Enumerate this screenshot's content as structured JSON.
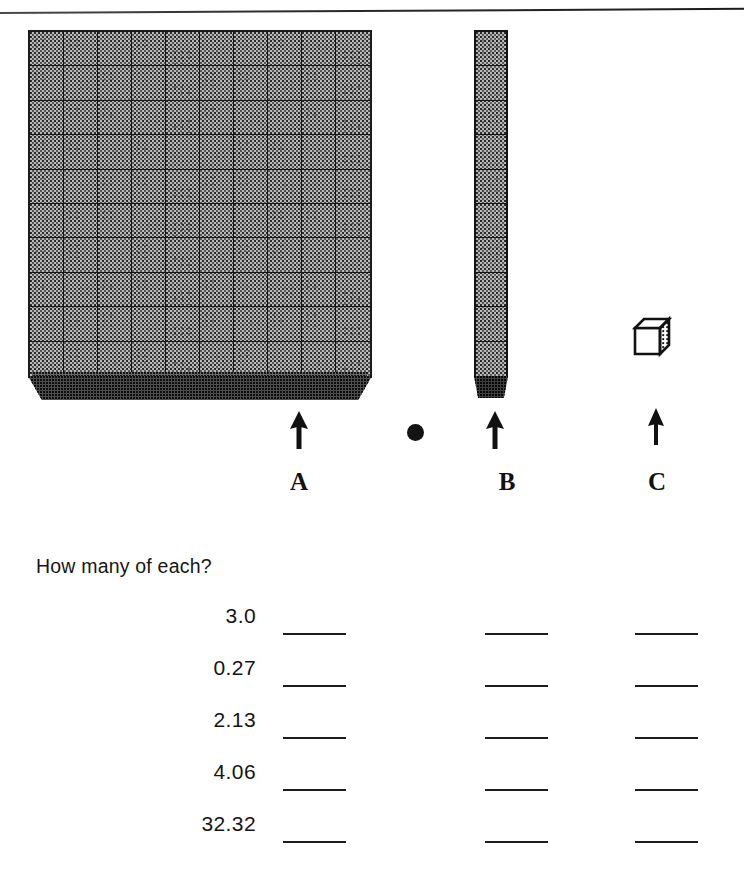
{
  "worksheet": {
    "question": "How many of each?",
    "columns": [
      {
        "label": "A",
        "icon": "hundreds-flat-block",
        "arrow": "up-arrow-icon"
      },
      {
        "label": "B",
        "icon": "tens-rod-block",
        "arrow": "up-arrow-icon"
      },
      {
        "label": "C",
        "icon": "unit-cube-block",
        "arrow": "up-arrow-icon"
      }
    ],
    "decimal_point": ".",
    "rows": [
      {
        "value": "3.0",
        "answer_a": "",
        "answer_b": "",
        "answer_c": ""
      },
      {
        "value": "0.27",
        "answer_a": "",
        "answer_b": "",
        "answer_c": ""
      },
      {
        "value": "2.13",
        "answer_a": "",
        "answer_b": "",
        "answer_c": ""
      },
      {
        "value": "4.06",
        "answer_a": "",
        "answer_b": "",
        "answer_c": ""
      },
      {
        "value": "32.32",
        "answer_a": "",
        "answer_b": "",
        "answer_c": ""
      }
    ],
    "colors": {
      "ink": "#141414",
      "block_fill": "#b9b9b9",
      "block_shadow": "#4e4e4e",
      "paper": "#ffffff"
    }
  }
}
